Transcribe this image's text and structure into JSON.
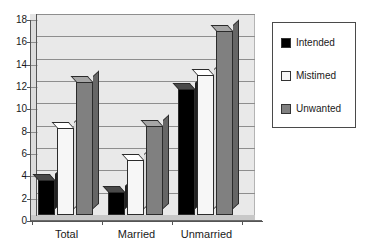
{
  "chart_data": {
    "type": "bar",
    "title": "",
    "subtitle": "",
    "xlabel": "",
    "ylabel": "",
    "categories": [
      "Total",
      "Married",
      "Unmarried"
    ],
    "series": [
      {
        "name": "Intended",
        "color": "#000000",
        "values": [
          3.1,
          2.1,
          11.3
        ]
      },
      {
        "name": "Mistimed",
        "color": "#f7f7f7",
        "values": [
          7.8,
          4.9,
          12.5
        ]
      },
      {
        "name": "Unwanted",
        "color": "#808080",
        "values": [
          11.9,
          8.0,
          16.5
        ]
      }
    ],
    "ylim": [
      0,
      18
    ],
    "yticks": [
      0,
      2,
      4,
      6,
      8,
      10,
      12,
      14,
      16,
      18
    ],
    "ytick_labels": [
      "0",
      "2",
      "4",
      "6",
      "8",
      "10",
      "12",
      "14",
      "16",
      "18"
    ],
    "grid": true,
    "grid_axis": "y",
    "legend_position": "right",
    "style": "3d-column",
    "plot_background": "#e9e9e9"
  },
  "legend": {
    "items": [
      {
        "label": "Intended",
        "swatch": "#000000"
      },
      {
        "label": "Mistimed",
        "swatch": "#f7f7f7"
      },
      {
        "label": "Unwanted",
        "swatch": "#808080"
      }
    ]
  }
}
